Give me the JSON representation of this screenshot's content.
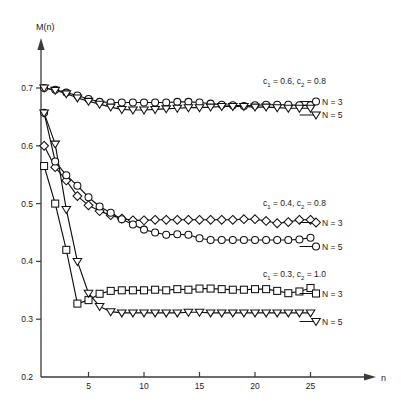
{
  "chart_data": {
    "type": "line",
    "title": "",
    "xlabel": "n",
    "ylabel": "M(n)",
    "xlim": [
      0,
      28.5
    ],
    "ylim": [
      0.2,
      0.74
    ],
    "grid": false,
    "legend_position": "right-inline",
    "x_ticks": [
      5,
      10,
      15,
      20,
      25
    ],
    "x_tick_labels": [
      "5",
      "10",
      "15",
      "20",
      "25"
    ],
    "y_ticks": [
      0.2,
      0.3,
      0.4,
      0.5,
      0.6,
      0.7
    ],
    "y_tick_labels": [
      "0.2",
      "0.3",
      "0.4",
      "0.5",
      "0.6",
      "0.7"
    ],
    "groups": [
      {
        "id": "group-c1-06",
        "annotation": "c1 = 0.6, c2 = 0.8",
        "annotation_parts": {
          "c_base": "c",
          "sub1": "1",
          "eq1": " = 0.6, ",
          "c_base2": "c",
          "sub2": "2",
          "eq2": " = 0.8"
        },
        "series": [
          {
            "name": "N = 3",
            "marker": "circle",
            "x": [
              1,
              2,
              3,
              4,
              5,
              6,
              7,
              8,
              9,
              10,
              11,
              12,
              13,
              14,
              15,
              16,
              17,
              18,
              19,
              20,
              21,
              22,
              23,
              24,
              25
            ],
            "y": [
              0.7,
              0.697,
              0.692,
              0.687,
              0.681,
              0.676,
              0.675,
              0.675,
              0.675,
              0.675,
              0.675,
              0.675,
              0.676,
              0.676,
              0.675,
              0.673,
              0.671,
              0.67,
              0.669,
              0.67,
              0.671,
              0.671,
              0.671,
              0.67,
              0.67
            ]
          },
          {
            "name": "N = 5",
            "marker": "triangle-down",
            "x": [
              1,
              2,
              3,
              4,
              5,
              6,
              7,
              8,
              9,
              10,
              11,
              12,
              13,
              14,
              15,
              16,
              17,
              18,
              19,
              20,
              21,
              22,
              23,
              24,
              25
            ],
            "y": [
              0.7,
              0.696,
              0.69,
              0.683,
              0.677,
              0.672,
              0.667,
              0.663,
              0.662,
              0.662,
              0.663,
              0.664,
              0.665,
              0.666,
              0.666,
              0.667,
              0.668,
              0.668,
              0.668,
              0.667,
              0.667,
              0.666,
              0.665,
              0.665,
              0.665
            ]
          }
        ]
      },
      {
        "id": "group-c1-04",
        "annotation": "c1 = 0.4, c2 = 0.8",
        "annotation_parts": {
          "c_base": "c",
          "sub1": "1",
          "eq1": " = 0.4, ",
          "c_base2": "c",
          "sub2": "2",
          "eq2": " = 0.8"
        },
        "series": [
          {
            "name": "N = 3",
            "marker": "diamond",
            "x": [
              1,
              2,
              3,
              4,
              5,
              6,
              7,
              8,
              9,
              10,
              11,
              12,
              13,
              14,
              15,
              16,
              17,
              18,
              19,
              20,
              21,
              22,
              23,
              24,
              25
            ],
            "y": [
              0.6,
              0.563,
              0.54,
              0.513,
              0.497,
              0.487,
              0.48,
              0.474,
              0.471,
              0.471,
              0.472,
              0.472,
              0.472,
              0.472,
              0.472,
              0.472,
              0.472,
              0.472,
              0.473,
              0.473,
              0.47,
              0.466,
              0.468,
              0.472,
              0.472
            ]
          },
          {
            "name": "N = 5",
            "marker": "circle",
            "x": [
              1,
              2,
              3,
              4,
              5,
              6,
              7,
              8,
              9,
              10,
              11,
              12,
              13,
              14,
              15,
              16,
              17,
              18,
              19,
              20,
              21,
              22,
              23,
              24,
              25
            ],
            "y": [
              0.657,
              0.573,
              0.549,
              0.531,
              0.511,
              0.495,
              0.484,
              0.473,
              0.464,
              0.455,
              0.45,
              0.446,
              0.447,
              0.446,
              0.44,
              0.437,
              0.437,
              0.437,
              0.437,
              0.437,
              0.437,
              0.437,
              0.437,
              0.438,
              0.441
            ]
          }
        ]
      },
      {
        "id": "group-c1-03",
        "annotation": "c1 = 0.3, c2 = 1.0",
        "annotation_parts": {
          "c_base": "c",
          "sub1": "1",
          "eq1": " = 0.3, ",
          "c_base2": "c",
          "sub2": "2",
          "eq2": " = 1.0"
        },
        "series": [
          {
            "name": "N = 3",
            "marker": "square",
            "x": [
              1,
              2,
              3,
              4,
              5,
              6,
              7,
              8,
              9,
              10,
              11,
              12,
              13,
              14,
              15,
              16,
              17,
              18,
              19,
              20,
              21,
              22,
              23,
              24,
              25
            ],
            "y": [
              0.565,
              0.5,
              0.42,
              0.327,
              0.333,
              0.344,
              0.349,
              0.35,
              0.35,
              0.35,
              0.351,
              0.35,
              0.352,
              0.351,
              0.353,
              0.353,
              0.352,
              0.351,
              0.351,
              0.352,
              0.352,
              0.349,
              0.345,
              0.348,
              0.354
            ]
          },
          {
            "name": "N = 5",
            "marker": "triangle-down",
            "x": [
              1,
              2,
              3,
              4,
              5,
              6,
              7,
              8,
              9,
              10,
              11,
              12,
              13,
              14,
              15,
              16,
              17,
              18,
              19,
              20,
              21,
              22,
              23,
              24,
              25
            ],
            "y": [
              0.657,
              0.603,
              0.49,
              0.4,
              0.345,
              0.322,
              0.313,
              0.311,
              0.311,
              0.311,
              0.311,
              0.311,
              0.311,
              0.312,
              0.312,
              0.311,
              0.311,
              0.311,
              0.311,
              0.311,
              0.311,
              0.311,
              0.311,
              0.311,
              0.311
            ]
          }
        ]
      }
    ],
    "annotations": [
      {
        "text": "c1 = 0.6, c2 = 0.8",
        "x_px": 263,
        "y_px": 84
      },
      {
        "text": "c1 = 0.4, c2 = 0.8",
        "x_px": 263,
        "y_px": 206
      },
      {
        "text": "c1 = 0.3, c2 = 1.0",
        "x_px": 263,
        "y_px": 277
      }
    ],
    "series_labels": [
      {
        "text": "N = 3",
        "x_px": 322,
        "y_px": 105
      },
      {
        "text": "N = 5",
        "x_px": 322,
        "y_px": 118
      },
      {
        "text": "N = 3",
        "x_px": 322,
        "y_px": 226
      },
      {
        "text": "N = 5",
        "x_px": 322,
        "y_px": 250
      },
      {
        "text": "N = 3",
        "x_px": 322,
        "y_px": 297
      },
      {
        "text": "N = 5",
        "x_px": 322,
        "y_px": 325
      }
    ]
  },
  "colors": {
    "background": "#ffffff",
    "ink": "#111111",
    "axis": "#3a3a3a",
    "marker_fill": "#ffffff"
  }
}
